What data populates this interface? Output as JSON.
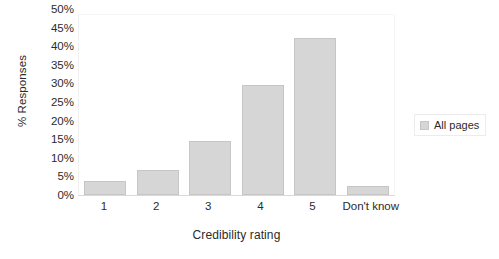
{
  "chart_data": {
    "type": "bar",
    "title": "",
    "subtitle": "",
    "xlabel": "Credibility rating",
    "ylabel": "% Responses",
    "categories": [
      "1",
      "2",
      "3",
      "4",
      "5",
      "Don't know"
    ],
    "series": [
      {
        "name": "All pages",
        "values": [
          4,
          7,
          15,
          30.5,
          43.5,
          2.5
        ]
      }
    ],
    "ylim": [
      0,
      50
    ],
    "ytick_labels": [
      "50%",
      "45%",
      "40%",
      "35%",
      "30%",
      "25%",
      "20%",
      "15%",
      "10%",
      "5%",
      "0%"
    ],
    "ytick_values": [
      50,
      45,
      40,
      35,
      30,
      25,
      20,
      15,
      10,
      5,
      0
    ],
    "grid": false,
    "legend_position": "right",
    "value_suffix": "%",
    "colors": {
      "bar_fill": "#d6d6d6",
      "bar_border": "#c6c6c6",
      "axis_line": "#d9d9d9",
      "text": "#2b2b2b",
      "background": "#ffffff"
    }
  },
  "legend": {
    "entries": [
      {
        "label": "All pages",
        "color": "#d6d6d6"
      }
    ]
  }
}
